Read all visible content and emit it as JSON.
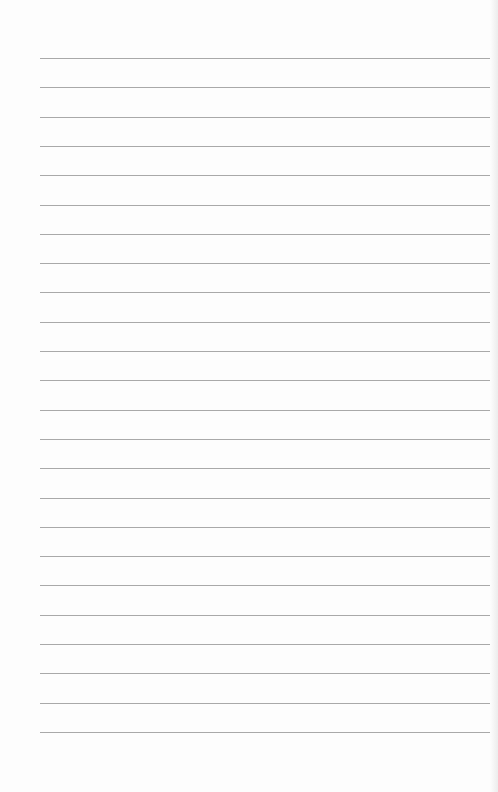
{
  "page": {
    "type": "lined-paper",
    "background": "#fdfdfd",
    "line_color": "#a9a9a9",
    "line_count": 24,
    "first_line_y": 58,
    "line_spacing": 29.3,
    "line_left": 40,
    "line_right": 492
  }
}
